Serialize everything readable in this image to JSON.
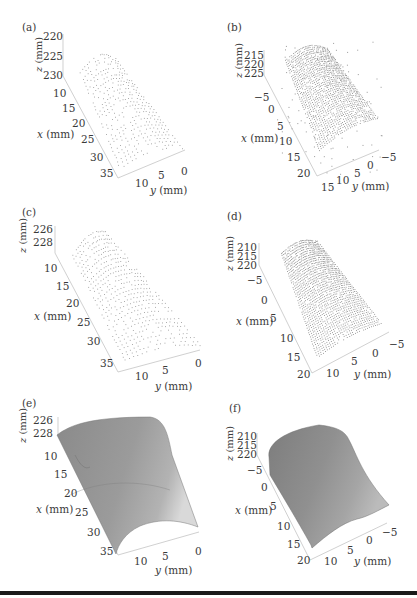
{
  "figure": {
    "panels": [
      {
        "id": "a",
        "label": "(a)",
        "kind": "point-cloud",
        "z_ticks": [
          "220",
          "225",
          "230"
        ],
        "x_ticks": [
          "10",
          "15",
          "20",
          "25",
          "30",
          "35"
        ],
        "y_ticks": [
          "10",
          "5",
          "0"
        ],
        "z_axis": "z (mm)",
        "x_axis": "x (mm)",
        "y_axis": "y (mm)"
      },
      {
        "id": "b",
        "label": "(b)",
        "kind": "point-cloud",
        "z_ticks": [
          "215",
          "220",
          "225"
        ],
        "x_ticks": [
          "−5",
          "0",
          "5",
          "10",
          "15",
          "20"
        ],
        "y_ticks": [
          "15",
          "10",
          "5",
          "0",
          "−5"
        ],
        "z_axis": "z (mm)",
        "x_axis": "x (mm)",
        "y_axis": "y (mm)"
      },
      {
        "id": "c",
        "label": "(c)",
        "kind": "point-cloud",
        "z_ticks": [
          "226",
          "228"
        ],
        "x_ticks": [
          "10",
          "15",
          "20",
          "25",
          "30",
          "35"
        ],
        "y_ticks": [
          "10",
          "5",
          "0"
        ],
        "z_axis": "z (mm)",
        "x_axis": "x (mm)",
        "y_axis": "y (mm)"
      },
      {
        "id": "d",
        "label": "(d)",
        "kind": "point-cloud",
        "z_ticks": [
          "210",
          "215",
          "220"
        ],
        "x_ticks": [
          "−5",
          "0",
          "5",
          "10",
          "15",
          "20"
        ],
        "y_ticks": [
          "10",
          "5",
          "0",
          "−5"
        ],
        "z_axis": "z (mm)",
        "x_axis": "x (mm)",
        "y_axis": "y (mm)"
      },
      {
        "id": "e",
        "label": "(e)",
        "kind": "surface",
        "z_ticks": [
          "226",
          "228"
        ],
        "x_ticks": [
          "10",
          "15",
          "20",
          "25",
          "30",
          "35"
        ],
        "y_ticks": [
          "10",
          "5",
          "0"
        ],
        "z_axis": "z (mm)",
        "x_axis": "x (mm)",
        "y_axis": "y (mm)"
      },
      {
        "id": "f",
        "label": "(f)",
        "kind": "surface",
        "z_ticks": [
          "210",
          "215",
          "220"
        ],
        "x_ticks": [
          "−5",
          "0",
          "5",
          "10",
          "15",
          "20"
        ],
        "y_ticks": [
          "10",
          "5",
          "0",
          "−5"
        ],
        "z_axis": "z (mm)",
        "x_axis": "x (mm)",
        "y_axis": "y (mm)"
      }
    ]
  },
  "chart_data": [
    {
      "type": "scatter",
      "title": "(a)",
      "subtype": "3d point cloud",
      "xlabel": "x (mm)",
      "ylabel": "y (mm)",
      "zlabel": "z (mm)",
      "xlim": [
        8,
        37
      ],
      "ylim": [
        -1,
        13
      ],
      "zlim": [
        220,
        230
      ],
      "x_ticks": [
        10,
        15,
        20,
        25,
        30,
        35
      ],
      "y_ticks": [
        10,
        5,
        0
      ],
      "z_ticks": [
        220,
        225,
        230
      ],
      "description": "Sparse dotted scan lines forming a cylindrical (curved) surface",
      "grid": false
    },
    {
      "type": "scatter",
      "title": "(b)",
      "subtype": "3d point cloud",
      "xlabel": "x (mm)",
      "ylabel": "y (mm)",
      "zlabel": "z (mm)",
      "xlim": [
        -7,
        22
      ],
      "ylim": [
        -6,
        16
      ],
      "zlim": [
        213,
        226
      ],
      "x_ticks": [
        -5,
        0,
        5,
        10,
        15,
        20
      ],
      "y_ticks": [
        15,
        10,
        5,
        0,
        -5
      ],
      "z_ticks": [
        215,
        220,
        225
      ],
      "description": "Dense point cloud of curved surface with scattered outliers",
      "grid": false
    },
    {
      "type": "scatter",
      "title": "(c)",
      "subtype": "3d point cloud",
      "xlabel": "x (mm)",
      "ylabel": "y (mm)",
      "zlabel": "z (mm)",
      "xlim": [
        8,
        37
      ],
      "ylim": [
        -1,
        13
      ],
      "zlim": [
        225,
        229
      ],
      "x_ticks": [
        10,
        15,
        20,
        25,
        30,
        35
      ],
      "y_ticks": [
        10,
        5,
        0
      ],
      "z_ticks": [
        226,
        228
      ],
      "description": "Filtered dotted point cloud of curved surface",
      "grid": false
    },
    {
      "type": "scatter",
      "title": "(d)",
      "subtype": "3d point cloud",
      "xlabel": "x (mm)",
      "ylabel": "y (mm)",
      "zlabel": "z (mm)",
      "xlim": [
        -7,
        21
      ],
      "ylim": [
        -6,
        12
      ],
      "zlim": [
        208,
        221
      ],
      "x_ticks": [
        -5,
        0,
        5,
        10,
        15,
        20
      ],
      "y_ticks": [
        10,
        5,
        0,
        -5
      ],
      "z_ticks": [
        210,
        215,
        220
      ],
      "description": "Filtered dense point cloud of curved surface",
      "grid": false
    },
    {
      "type": "surface",
      "title": "(e)",
      "xlabel": "x (mm)",
      "ylabel": "y (mm)",
      "zlabel": "z (mm)",
      "xlim": [
        8,
        37
      ],
      "ylim": [
        -1,
        13
      ],
      "zlim": [
        225,
        229
      ],
      "x_ticks": [
        10,
        15,
        20,
        25,
        30,
        35
      ],
      "y_ticks": [
        10,
        5,
        0
      ],
      "z_ticks": [
        226,
        228
      ],
      "description": "Reconstructed gray shaded cylindrical surface",
      "grid": false
    },
    {
      "type": "surface",
      "title": "(f)",
      "xlabel": "x (mm)",
      "ylabel": "y (mm)",
      "zlabel": "z (mm)",
      "xlim": [
        -7,
        21
      ],
      "ylim": [
        -6,
        12
      ],
      "zlim": [
        208,
        221
      ],
      "x_ticks": [
        -5,
        0,
        5,
        10,
        15,
        20
      ],
      "y_ticks": [
        10,
        5,
        0,
        -5
      ],
      "z_ticks": [
        210,
        215,
        220
      ],
      "description": "Reconstructed gray shaded curved surface",
      "grid": false
    }
  ]
}
